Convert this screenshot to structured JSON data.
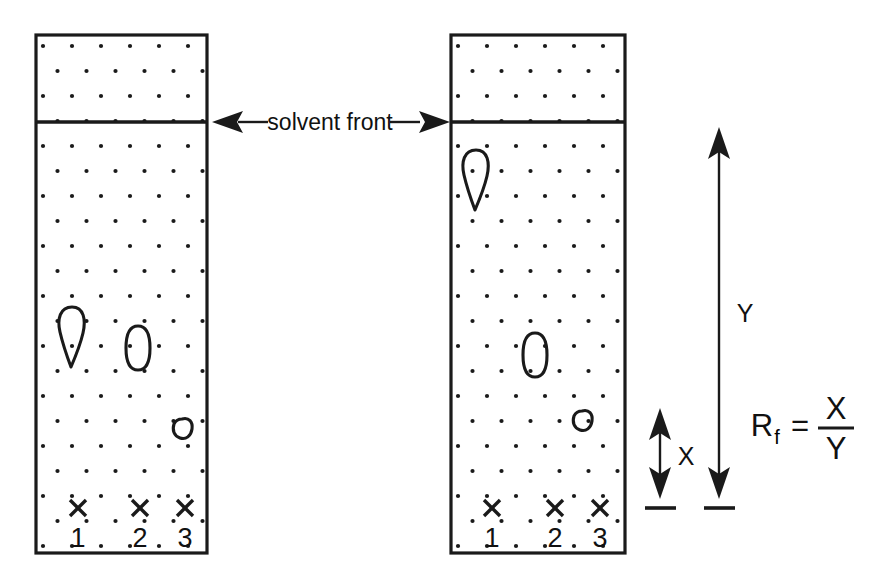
{
  "figure": {
    "background_color": "#ffffff",
    "ink_color": "#1a1a1a"
  },
  "labels": {
    "solvent_front": "solvent front",
    "distance_x": "X",
    "distance_y": "Y",
    "formula_symbol": "R",
    "formula_subscript": "f",
    "formula_equals": "=",
    "formula_numerator": "X",
    "formula_denominator": "Y"
  },
  "lanes": [
    {
      "id": "lane-1",
      "label": "1"
    },
    {
      "id": "lane-2",
      "label": "2"
    },
    {
      "id": "lane-3",
      "label": "3"
    }
  ],
  "plates": [
    {
      "id": "plate-left",
      "name": "left-tlc-plate",
      "x": 36,
      "y": 35,
      "width": 171,
      "height": 518,
      "solvent_front_y": 122,
      "origin_y": 508,
      "lane_x": [
        78,
        140,
        185
      ],
      "spots": [
        {
          "lane": "1",
          "shape": "teardrop",
          "cx": 72,
          "cy": 337,
          "rx": 13,
          "ry": 30
        },
        {
          "lane": "2",
          "shape": "oval",
          "cx": 138,
          "cy": 348,
          "rx": 11,
          "ry": 22
        },
        {
          "lane": "3",
          "shape": "small-oval",
          "cx": 182,
          "cy": 428,
          "rx": 9,
          "ry": 7
        }
      ]
    },
    {
      "id": "plate-right",
      "name": "right-tlc-plate",
      "x": 451,
      "y": 35,
      "width": 174,
      "height": 518,
      "solvent_front_y": 122,
      "origin_y": 508,
      "lane_x": [
        492,
        555,
        600
      ],
      "spots": [
        {
          "lane": "1",
          "shape": "teardrop",
          "cx": 475,
          "cy": 180,
          "rx": 13,
          "ry": 30
        },
        {
          "lane": "2",
          "shape": "oval",
          "cx": 535,
          "cy": 355,
          "rx": 11,
          "ry": 22
        },
        {
          "lane": "3",
          "shape": "small-oval",
          "cx": 580,
          "cy": 420,
          "rx": 9,
          "ry": 7
        }
      ]
    }
  ],
  "annotations": {
    "solvent_front_arrow": {
      "name": "solvent-front-double-arrow",
      "left_tip_x": 213,
      "right_tip_x": 449,
      "y": 122,
      "label": "solvent front"
    },
    "x_measure": {
      "name": "x-distance-arrow",
      "x": 660,
      "top_y": 410,
      "bottom_y": 497,
      "base_y": 506,
      "label": "X"
    },
    "y_measure": {
      "name": "y-distance-arrow",
      "x": 719,
      "top_y": 128,
      "bottom_y": 497,
      "base_y": 506,
      "label": "Y"
    },
    "formula": {
      "name": "rf-formula",
      "x": 748,
      "y": 425
    }
  },
  "stipple": {
    "description": "offset grid of small dots representing silica adsorbent layer",
    "spacing_x": 29,
    "spacing_y": 25,
    "dot_radius": 2.1
  }
}
